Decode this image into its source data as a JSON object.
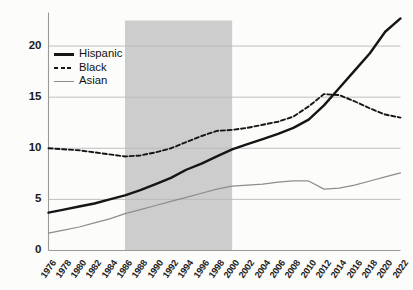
{
  "chart_data": {
    "type": "line",
    "title": "",
    "subtitle": "",
    "xlabel": "",
    "ylabel": "",
    "xlim": [
      1976,
      2022
    ],
    "ylim": [
      0,
      22.5
    ],
    "yticks": [
      0,
      5,
      10,
      15,
      20
    ],
    "grid": "horizontal",
    "legend_position": "top-left-inside",
    "x": [
      1976,
      1978,
      1980,
      1982,
      1984,
      1986,
      1988,
      1990,
      1992,
      1994,
      1996,
      1998,
      2000,
      2002,
      2004,
      2006,
      2008,
      2010,
      2012,
      2014,
      2016,
      2018,
      2020,
      2022
    ],
    "xticklabels": [
      "1976",
      "1978",
      "1980",
      "1982",
      "1984",
      "1986",
      "1988",
      "1990",
      "1992",
      "1994",
      "1996",
      "1998",
      "2000",
      "2002",
      "2004",
      "2006",
      "2008",
      "2010",
      "2012",
      "2014",
      "2016",
      "2018",
      "2020",
      "2022"
    ],
    "series": [
      {
        "name": "Hispanic",
        "color": "#151515",
        "style": "solid",
        "width": 2.4,
        "values": [
          3.7,
          4.0,
          4.3,
          4.6,
          5.0,
          5.4,
          5.9,
          6.5,
          7.1,
          7.9,
          8.5,
          9.2,
          9.9,
          10.4,
          10.9,
          11.4,
          12.0,
          12.8,
          14.2,
          15.9,
          17.6,
          19.3,
          21.4,
          22.7
        ]
      },
      {
        "name": "Black",
        "color": "#151515",
        "style": "dashed",
        "width": 1.9,
        "values": [
          10.0,
          9.9,
          9.8,
          9.6,
          9.4,
          9.2,
          9.3,
          9.6,
          10.0,
          10.6,
          11.2,
          11.7,
          11.8,
          12.0,
          12.3,
          12.6,
          13.1,
          14.1,
          15.3,
          15.2,
          14.6,
          13.9,
          13.3,
          13.0
        ]
      },
      {
        "name": "Asian",
        "color": "#8d8d8d",
        "style": "solid",
        "width": 1.25,
        "values": [
          1.7,
          2.0,
          2.3,
          2.7,
          3.1,
          3.6,
          4.0,
          4.4,
          4.8,
          5.2,
          5.6,
          6.0,
          6.3,
          6.4,
          6.5,
          6.7,
          6.8,
          6.8,
          6.0,
          6.1,
          6.4,
          6.8,
          7.2,
          7.6
        ]
      }
    ],
    "shaded_regions": [
      {
        "name": "highlight-band",
        "x0": 1986,
        "x1": 2000,
        "color": "#cdcdcd"
      }
    ]
  },
  "legend": {
    "items": [
      {
        "label": "Hispanic",
        "key": "solid-line-key"
      },
      {
        "label": "Black",
        "key": "dashed-line-key"
      },
      {
        "label": "Asian",
        "key": "thin-line-key"
      }
    ]
  },
  "axes": {
    "y_tick_labels": [
      "0",
      "5",
      "10",
      "15",
      "20"
    ],
    "axis_color": "#9a9a9a",
    "grid_color": "#b9b9b9"
  }
}
